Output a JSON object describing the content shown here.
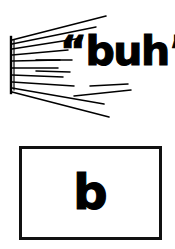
{
  "figure": {
    "background_color": "#ffffff",
    "ink_color": "#000000"
  },
  "sound_figure": {
    "name": "sound-emanation-diagram",
    "source_bar": {
      "label": "sound-source-bar",
      "x": 11,
      "y_top": 38,
      "y_bottom": 92,
      "thickness": 2
    },
    "spoken_text": "“buh”",
    "syllable": "buh",
    "open_quote": "“",
    "close_quote": "”",
    "ray_count": 10,
    "rays": [
      {
        "x1": 12,
        "y1": 40,
        "x2": 106,
        "y2": 16,
        "width": 1.6
      },
      {
        "x1": 12,
        "y1": 44,
        "x2": 96,
        "y2": 26,
        "width": 1.5
      },
      {
        "x1": 12,
        "y1": 49,
        "x2": 82,
        "y2": 37,
        "width": 1.5
      },
      {
        "x1": 12,
        "y1": 55,
        "x2": 68,
        "y2": 49,
        "width": 1.5
      },
      {
        "x1": 12,
        "y1": 61,
        "x2": 60,
        "y2": 59,
        "width": 1.5
      },
      {
        "x1": 12,
        "y1": 68,
        "x2": 58,
        "y2": 68,
        "width": 1.5
      },
      {
        "x1": 12,
        "y1": 75,
        "x2": 63,
        "y2": 77,
        "width": 1.5
      },
      {
        "x1": 12,
        "y1": 82,
        "x2": 74,
        "y2": 86,
        "width": 1.5
      },
      {
        "x1": 12,
        "y1": 88,
        "x2": 104,
        "y2": 104,
        "width": 1.6
      },
      {
        "x1": 12,
        "y1": 92,
        "x2": 108,
        "y2": 116,
        "width": 1.6
      }
    ],
    "inner_rays": [
      {
        "x1": 36,
        "y1": 60,
        "x2": 72,
        "y2": 60,
        "width": 1.5
      },
      {
        "x1": 36,
        "y1": 71,
        "x2": 70,
        "y2": 72,
        "width": 1.5
      },
      {
        "x1": 90,
        "y1": 86,
        "x2": 128,
        "y2": 84,
        "width": 1.5
      },
      {
        "x1": 74,
        "y1": 96,
        "x2": 130,
        "y2": 90,
        "width": 1.5
      }
    ]
  },
  "grapheme_figure": {
    "name": "grapheme-box",
    "letter": "b",
    "border_color": "#111111",
    "border_width": 3,
    "fill_color": "#ffffff",
    "x": 19,
    "y": 146,
    "width": 143,
    "height": 94
  }
}
